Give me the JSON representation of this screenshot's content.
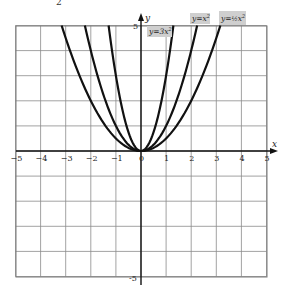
{
  "page": {
    "cropped_fragment": "2"
  },
  "chart_data": {
    "type": "line",
    "title": "",
    "xlabel": "x",
    "ylabel": "y",
    "xlim": [
      -5,
      5
    ],
    "ylim": [
      -5,
      5
    ],
    "grid": true,
    "x_ticks": [
      "-5",
      "-4",
      "-3",
      "-2",
      "-1",
      "0",
      "1",
      "2",
      "3",
      "4",
      "5"
    ],
    "y_ticks": [
      "5",
      "-5"
    ],
    "series": [
      {
        "name": "y=3x²",
        "label_main": "y=3x",
        "label_exp": "2",
        "coef": 3
      },
      {
        "name": "y=x²",
        "label_main": "y=x",
        "label_exp": "2",
        "coef": 1
      },
      {
        "name": "y=½x²",
        "label_main": "y=",
        "label_frac": "½",
        "label_tail": "x",
        "label_exp": "2",
        "coef": 0.5
      }
    ]
  }
}
